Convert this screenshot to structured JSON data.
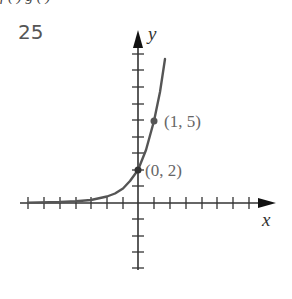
{
  "problem": {
    "number": "25"
  },
  "top_cut_text": "f ( )            g ( )",
  "graph": {
    "axis_labels": {
      "x": "x",
      "y": "y"
    },
    "points": [
      {
        "label": "(0, 2)",
        "x": 0,
        "y": 2
      },
      {
        "label": "(1, 5)",
        "x": 1,
        "y": 5
      }
    ],
    "curve": "exponential y = 2·(5/2)^x",
    "x_ticks": [
      -7,
      -6,
      -5,
      -4,
      -3,
      -2,
      -1,
      1,
      2,
      3,
      4,
      5,
      6,
      7
    ],
    "y_ticks": [
      -5,
      -4,
      -3,
      -2,
      -1,
      1,
      2,
      3,
      4,
      5,
      6,
      7,
      8,
      9
    ],
    "colors": {
      "axis": "#333333",
      "curve": "#555555",
      "label": "#666666"
    }
  }
}
